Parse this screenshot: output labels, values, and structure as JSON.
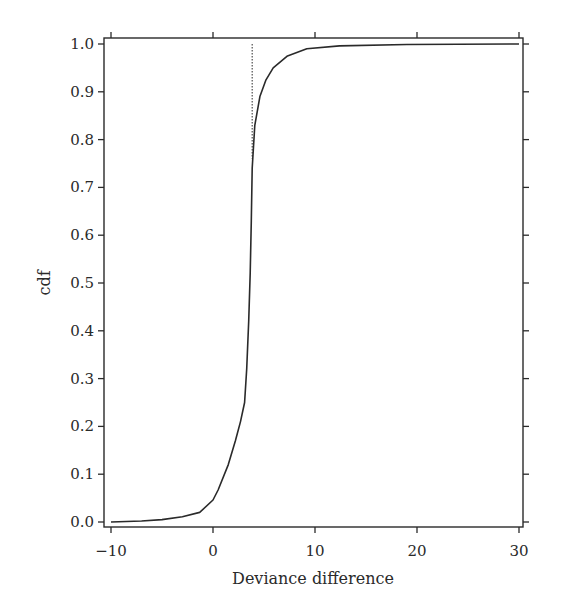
{
  "chart_data": {
    "type": "line",
    "title": "",
    "xlabel": "Deviance difference",
    "ylabel": "cdf",
    "xlim": [
      -10,
      30
    ],
    "ylim": [
      0.0,
      1.0
    ],
    "grid": false,
    "legend": null,
    "x_ticks": [
      -10,
      0,
      10,
      20,
      30
    ],
    "x_tick_labels": [
      "−10",
      "0",
      "10",
      "20",
      "30"
    ],
    "y_ticks": [
      0.0,
      0.1,
      0.2,
      0.3,
      0.4,
      0.5,
      0.6,
      0.7,
      0.8,
      0.9,
      1.0
    ],
    "y_tick_labels": [
      "0.0",
      "0.1",
      "0.2",
      "0.3",
      "0.4",
      "0.5",
      "0.6",
      "0.7",
      "0.8",
      "0.9",
      "1.0"
    ],
    "series": [
      {
        "name": "empirical cdf of deviance difference",
        "style": "solid",
        "color": "#2a2a2a",
        "x": [
          -10,
          -7,
          -5,
          -3,
          -1.3,
          0,
          0.5,
          1.5,
          2.2,
          2.7,
          3.1,
          3.3,
          3.5,
          3.65,
          3.75,
          3.84,
          4.1,
          4.6,
          5.2,
          5.9,
          7.3,
          9.2,
          12.4,
          19,
          30
        ],
        "values": [
          0.0,
          0.002,
          0.005,
          0.011,
          0.02,
          0.046,
          0.067,
          0.12,
          0.17,
          0.21,
          0.25,
          0.32,
          0.42,
          0.52,
          0.63,
          0.74,
          0.83,
          0.89,
          0.925,
          0.95,
          0.975,
          0.99,
          0.996,
          0.999,
          1.0
        ]
      }
    ],
    "annotations": [
      {
        "type": "vline",
        "style": "dotted",
        "x": 3.84,
        "y_from": 0.76,
        "y_to": 1.0
      }
    ]
  },
  "layout": {
    "frame": {
      "left": 104,
      "top": 38,
      "right": 523,
      "bottom": 527
    },
    "x_pixel": {
      "min_val": -10,
      "min_px": 111,
      "max_val": 30,
      "max_px": 519
    },
    "y_pixel": {
      "min_val": 0.0,
      "min_px": 522,
      "max_val": 1.0,
      "max_px": 44
    }
  }
}
